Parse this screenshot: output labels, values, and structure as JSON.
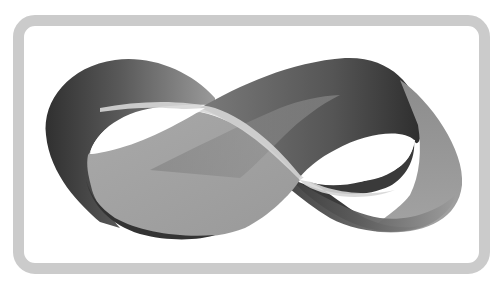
{
  "image": {
    "subject": "Möbius strip",
    "description": "Grayscale Möbius strip illustration inside a rounded rectangular frame"
  },
  "colors": {
    "background": "#ffffff",
    "frame": "#cbcbcb",
    "band_dark": "#3a3a3a",
    "band_mid": "#6e6e6e",
    "band_light": "#a6a6a6",
    "edge_highlight": "#d8d8d8"
  }
}
